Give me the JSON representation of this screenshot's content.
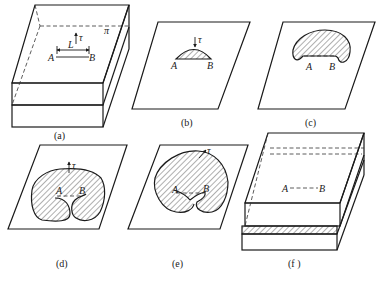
{
  "figure": {
    "panels": [
      {
        "id": "a",
        "caption": "(a)",
        "labels": {
          "A": "A",
          "B": "B",
          "L": "L",
          "tau": "τ",
          "plane": "π"
        }
      },
      {
        "id": "b",
        "caption": "(b)",
        "labels": {
          "A": "A",
          "B": "B",
          "tau": "τ"
        }
      },
      {
        "id": "c",
        "caption": "(c)",
        "labels": {
          "A": "A",
          "B": "B"
        }
      },
      {
        "id": "d",
        "caption": "(d)",
        "labels": {
          "A": "A",
          "B": "B",
          "tau": "τ"
        }
      },
      {
        "id": "e",
        "caption": "(e)",
        "labels": {
          "A": "A",
          "B": "B",
          "tau": "τ"
        }
      },
      {
        "id": "f",
        "caption": "(f )",
        "labels": {
          "A": "A",
          "B": "B"
        }
      }
    ],
    "colors": {
      "line": "#1a1a1a",
      "background": "#ffffff"
    }
  }
}
